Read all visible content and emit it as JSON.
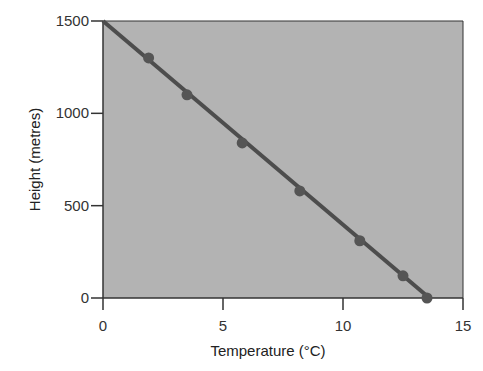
{
  "chart_data": {
    "type": "line",
    "title": "",
    "xlabel": "Temperature (°C)",
    "ylabel": "Height (metres)",
    "xlim": [
      0,
      15
    ],
    "ylim": [
      0,
      1500
    ],
    "xticks": [
      0,
      5,
      10,
      15
    ],
    "yticks": [
      0,
      500,
      1000,
      1500
    ],
    "grid": false,
    "legend": null,
    "line": {
      "from": [
        0,
        1500
      ],
      "to": [
        13.6,
        0
      ]
    },
    "series": [
      {
        "name": "Height vs Temperature",
        "x": [
          1.9,
          3.5,
          5.8,
          8.2,
          10.7,
          12.5,
          13.5
        ],
        "y": [
          1300,
          1100,
          840,
          580,
          310,
          120,
          0
        ]
      }
    ],
    "colors": {
      "plot_bg": "#b3b3b3",
      "line": "#4d4d4d",
      "marker": "#555555",
      "axis": "#333333"
    }
  }
}
